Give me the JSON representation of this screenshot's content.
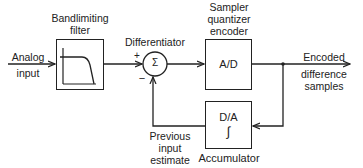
{
  "input": {
    "label_line1": "Analog",
    "label_line2": "input"
  },
  "filter": {
    "label_line1": "Bandlimiting",
    "label_line2": "filter",
    "icon": "lowpass-response-icon"
  },
  "differentiator": {
    "label": "Differentiator",
    "symbol": "Σ",
    "plus": "+",
    "minus": "−"
  },
  "encoder": {
    "label_line1": "Sampler",
    "label_line2": "quantizer",
    "label_line3": "encoder",
    "box_text": "A/D"
  },
  "output": {
    "label_line1": "Encoded",
    "label_line2": "difference",
    "label_line3": "samples"
  },
  "accumulator": {
    "box_text": "D/A",
    "symbol": "∫",
    "label": "Accumulator"
  },
  "feedback": {
    "label_line1": "Previous",
    "label_line2": "input",
    "label_line3": "estimate"
  },
  "colors": {
    "line": "#222222",
    "background": "#ffffff"
  }
}
